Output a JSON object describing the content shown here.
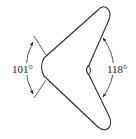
{
  "diagram": {
    "shape": "boomerang",
    "stroke_color": "#2b2b2b",
    "background": "#ffffff",
    "angles": [
      {
        "id": "outer-left",
        "label": "101°",
        "value": 101,
        "unit": "degrees"
      },
      {
        "id": "inner-right",
        "label": "118°",
        "value": 118,
        "unit": "degrees"
      }
    ]
  }
}
